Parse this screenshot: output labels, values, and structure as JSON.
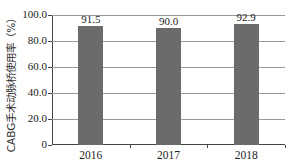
{
  "chart_data": {
    "type": "bar",
    "title": "",
    "xlabel": "",
    "ylabel": "CABG手术动脉桥使用率（%）",
    "categories": [
      "2016",
      "2017",
      "2018"
    ],
    "values": [
      91.5,
      90.0,
      92.9
    ],
    "value_labels": [
      "91.5",
      "90.0",
      "92.9"
    ],
    "ylim": [
      0,
      100
    ],
    "yticks": [
      "0",
      "20.0",
      "40.0",
      "60.0",
      "80.0",
      "100.0"
    ],
    "grid": true,
    "legend": null,
    "bar_color": "#6b6b6b"
  }
}
